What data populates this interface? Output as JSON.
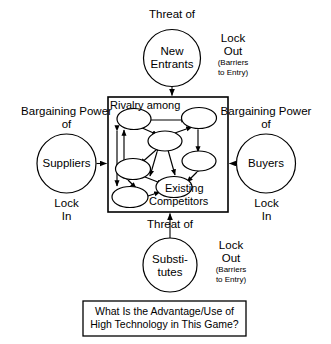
{
  "diagram": {
    "colors": {
      "stroke": "#000000",
      "fill": "#ffffff",
      "text": "#000000"
    }
  },
  "top_force": {
    "threat_label": "Threat of",
    "circle_line1": "New",
    "circle_line2": "Entrants",
    "lock_line1": "Lock",
    "lock_line2": "Out",
    "lock_note1": "(Barriers",
    "lock_note2": "to Entry)"
  },
  "left_force": {
    "power_line1": "Bargaining Power",
    "power_line2": "of",
    "circle_label": "Suppliers",
    "lock_line1": "Lock",
    "lock_line2": "In"
  },
  "right_force": {
    "power_line1": "Bargaining Power",
    "power_line2": "of",
    "circle_label": "Buyers",
    "lock_line1": "Lock",
    "lock_line2": "In"
  },
  "bottom_force": {
    "threat_label": "Threat of",
    "circle_line1": "Substi-",
    "circle_line2": "tutes",
    "lock_line1": "Lock",
    "lock_line2": "Out",
    "lock_note1": "(Barriers",
    "lock_note2": "to Entry)"
  },
  "center_box": {
    "label_top": "Rivalry among",
    "label_bottom_line1": "Existing",
    "label_bottom_line2": "Competitors",
    "node_count": 6
  },
  "caption": {
    "line1": "What Is the Advantage/Use of",
    "line2": "High Technology in This Game?"
  }
}
